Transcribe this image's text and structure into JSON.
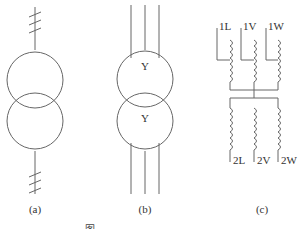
{
  "figure": {
    "panels": [
      {
        "id": "a",
        "label": "(a)",
        "type": "single-line transformer symbol with three-phase tick marks"
      },
      {
        "id": "b",
        "label": "(b)",
        "type": "three-line transformer symbol",
        "primary_connection": "Y",
        "secondary_connection": "Y"
      },
      {
        "id": "c",
        "label": "(c)",
        "type": "winding diagram",
        "primary_terminals": [
          "1L",
          "1V",
          "1W"
        ],
        "secondary_terminals": [
          "2L",
          "2V",
          "2W"
        ]
      }
    ],
    "caption": "图 ..."
  },
  "style": {
    "line_color": "#666666",
    "text_color": "#333333"
  }
}
